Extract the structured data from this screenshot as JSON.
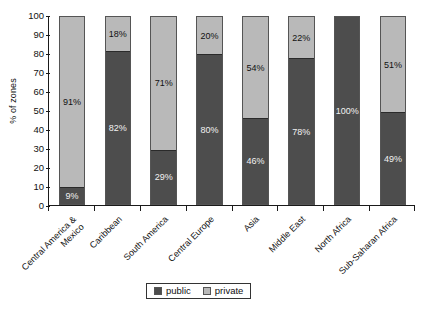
{
  "chart_data": {
    "type": "bar",
    "subtype": "stacked-100-percent",
    "title": "",
    "xlabel": "",
    "ylabel": "% of zones",
    "ylim": [
      0,
      100
    ],
    "ytick_step": 10,
    "yticks": [
      100,
      90,
      80,
      70,
      60,
      50,
      40,
      30,
      20,
      10,
      0
    ],
    "grid": false,
    "legend_position": "bottom-center",
    "categories": [
      "Central America & Mexico",
      "Caribbean",
      "South America",
      "Central Europe",
      "Asia",
      "Middle East",
      "North Africa",
      "Sub-Saharan Africa"
    ],
    "category_lines": [
      [
        "Central America &",
        "Mexico"
      ],
      [
        "Caribbean",
        ""
      ],
      [
        "South America",
        ""
      ],
      [
        "Central Europe",
        ""
      ],
      [
        "Asia",
        ""
      ],
      [
        "Middle East",
        ""
      ],
      [
        "North Africa",
        ""
      ],
      [
        "Sub-Saharan Africa",
        ""
      ]
    ],
    "series": [
      {
        "name": "public",
        "color": "#4d4d4d",
        "values": [
          9,
          82,
          29,
          80,
          46,
          78,
          100,
          49
        ],
        "labels": [
          "9%",
          "82%",
          "29%",
          "80%",
          "46%",
          "78%",
          "100%",
          "49%"
        ]
      },
      {
        "name": "private",
        "color": "#b9b9b9",
        "values": [
          91,
          18,
          71,
          20,
          54,
          22,
          0,
          51
        ],
        "labels": [
          "91%",
          "18%",
          "71%",
          "20%",
          "54%",
          "22%",
          "",
          "51%"
        ]
      }
    ]
  },
  "legend": {
    "items": [
      {
        "label": "public",
        "color": "#4d4d4d"
      },
      {
        "label": "private",
        "color": "#b9b9b9"
      }
    ]
  },
  "axis": {
    "y_title": "% of zones"
  }
}
